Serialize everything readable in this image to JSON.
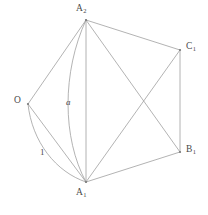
{
  "figure": {
    "type": "geometric-diagram",
    "width": 208,
    "height": 215,
    "background_color": "#ffffff",
    "stroke_color": "#9a9a9a",
    "text_color": "#4a4a4a",
    "vertices": [
      {
        "id": "A2",
        "base": "A",
        "subscript": "2",
        "label": "A₂",
        "x": 86,
        "y": 20,
        "label_x": 76,
        "label_y": 4
      },
      {
        "id": "C1",
        "base": "C",
        "subscript": "1",
        "label": "C₁",
        "x": 180,
        "y": 50,
        "label_x": 186,
        "label_y": 42
      },
      {
        "id": "B1",
        "base": "B",
        "subscript": "1",
        "label": "B₁",
        "x": 180,
        "y": 152,
        "label_x": 186,
        "label_y": 145
      },
      {
        "id": "A1",
        "base": "A",
        "subscript": "1",
        "label": "A₁",
        "x": 86,
        "y": 182,
        "label_x": 76,
        "label_y": 188
      },
      {
        "id": "O",
        "base": "O",
        "subscript": "",
        "label": "O",
        "x": 28,
        "y": 104,
        "label_x": 14,
        "label_y": 96
      }
    ],
    "straight_edges": [
      {
        "id": "O-A2",
        "from": "O",
        "to": "A2"
      },
      {
        "id": "A2-C1",
        "from": "A2",
        "to": "C1"
      },
      {
        "id": "C1-B1",
        "from": "C1",
        "to": "B1"
      },
      {
        "id": "B1-A1",
        "from": "B1",
        "to": "A1"
      },
      {
        "id": "A2-A1",
        "from": "A2",
        "to": "A1"
      },
      {
        "id": "A2-B1",
        "from": "A2",
        "to": "B1"
      },
      {
        "id": "A1-C1",
        "from": "A1",
        "to": "C1"
      },
      {
        "id": "O-A1",
        "from": "O",
        "to": "A1"
      }
    ],
    "arcs": [
      {
        "id": "arc-a",
        "from": "A2",
        "to": "A1",
        "label": "a",
        "italic": true,
        "label_x": 66,
        "label_y": 98,
        "bow": "left"
      },
      {
        "id": "arc-1",
        "from": "O",
        "to": "A1",
        "label": "1",
        "italic": false,
        "label_x": 40,
        "label_y": 148,
        "bow": "left"
      }
    ]
  }
}
